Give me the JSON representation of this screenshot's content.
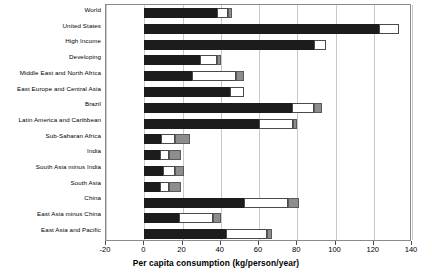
{
  "chart_data": {
    "type": "bar",
    "orientation": "horizontal",
    "stacked": true,
    "title": "",
    "xlabel": "Per capita consumption (kg/person/year)",
    "ylabel": "",
    "xlim": [
      -20,
      140
    ],
    "xticks": [
      -20,
      0,
      20,
      40,
      60,
      80,
      100,
      120,
      140
    ],
    "xtick_labels": [
      "-20",
      "0",
      "20",
      "40",
      "60",
      "80",
      "100",
      "120",
      "140"
    ],
    "grid": true,
    "grid_axis": "x",
    "legend": "none",
    "categories": [
      "World",
      "United States",
      "High Income",
      "Developing",
      "Middle East and North Africa",
      "East Europe and Central Asia",
      "Brazil",
      "Latin America and Caribbean",
      "Sub-Saharan Africa",
      "India",
      "South Asia minus India",
      "South Asia",
      "China",
      "East Asia minus China",
      "East Asia and Pacific"
    ],
    "series": [
      {
        "name": "dark-segment",
        "color": "#1c1c1c",
        "values": [
          38,
          123,
          89,
          29,
          25,
          45,
          77,
          60,
          9,
          8,
          10,
          8,
          52,
          18,
          43
        ]
      },
      {
        "name": "white-segment",
        "color": "#ffffff",
        "values": [
          6,
          10,
          6,
          9,
          23,
          7,
          12,
          18,
          7,
          5,
          6,
          5,
          23,
          18,
          21
        ]
      },
      {
        "name": "gray-segment",
        "color": "#8d8d8d",
        "values": [
          2,
          0,
          0,
          2,
          4,
          0,
          4,
          2,
          8,
          6,
          5,
          6,
          6,
          4,
          3
        ]
      }
    ],
    "totals": [
      46,
      133,
      95,
      40,
      52,
      52,
      93,
      80,
      24,
      19,
      21,
      19,
      81,
      40,
      67
    ]
  }
}
